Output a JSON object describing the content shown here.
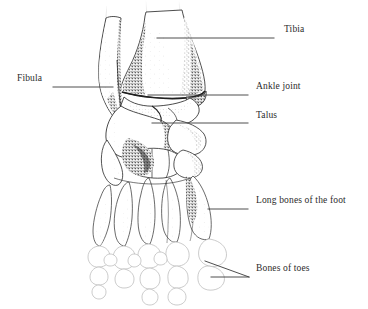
{
  "figure": {
    "view": "anterior/dorsal view of right foot",
    "style": "pen-and-ink stipple medical illustration",
    "background_color": "#ffffff",
    "ink_color": "#2b2b2b",
    "light_outline_color": "#b9b9b9",
    "leader_line_color": "#3a3a3a"
  },
  "labels": [
    {
      "id": "tibia",
      "text": "Tibia",
      "text_x": 284,
      "text_y": 31,
      "leader": {
        "x1": 157,
        "y1": 38,
        "x2": 274,
        "y2": 38
      }
    },
    {
      "id": "fibula",
      "text": "Fibula",
      "text_x": 17,
      "text_y": 80,
      "leader": {
        "x1": 53,
        "y1": 87,
        "x2": 113,
        "y2": 87
      }
    },
    {
      "id": "ankle-joint",
      "text": "Ankle joint",
      "text_x": 256,
      "text_y": 88,
      "leader": {
        "x1": 148,
        "y1": 95,
        "x2": 248,
        "y2": 95
      }
    },
    {
      "id": "talus",
      "text": "Talus",
      "text_x": 256,
      "text_y": 117,
      "leader": {
        "x1": 152,
        "y1": 123,
        "x2": 248,
        "y2": 123
      }
    },
    {
      "id": "long-bones-of-the-foot",
      "text": "Long bones of the foot",
      "text_x": 256,
      "text_y": 202,
      "leader": {
        "x1": 208,
        "y1": 209,
        "x2": 248,
        "y2": 209
      }
    },
    {
      "id": "bones-of-toes",
      "text": "Bones of toes",
      "text_x": 256,
      "text_y": 270,
      "leader_fork": {
        "apex_x": 249,
        "apex_y": 277,
        "upper_x": 205,
        "upper_y": 261,
        "lower_x": 211,
        "lower_y": 277
      }
    }
  ],
  "anatomy": {
    "bones_depicted": [
      "Tibia",
      "Fibula",
      "Talus",
      "Calcaneus",
      "Navicular",
      "Cuneiforms",
      "Cuboid",
      "Metatarsals",
      "Phalanges"
    ],
    "toe_count": 5,
    "metatarsal_count": 5
  }
}
